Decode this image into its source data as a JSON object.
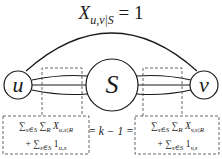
{
  "diagram": {
    "title": {
      "base": "X",
      "subscript": "u,v|S",
      "rhs": "= 1"
    },
    "nodes": [
      {
        "id": "u",
        "label": "u"
      },
      {
        "id": "S",
        "label": "S"
      },
      {
        "id": "v",
        "label": "v"
      }
    ],
    "equation": {
      "left": {
        "line1_sum1": "∑",
        "line1_sum1_sub": "s∈S",
        "line1_sum2": "∑",
        "line1_sum2_sub": "R",
        "line1_var": "X",
        "line1_var_sub": "u,s|R",
        "line2_plus": "+ ∑",
        "line2_sum_sub": "s∈S",
        "line2_var": "1",
        "line2_var_sub": "u,s"
      },
      "middle": "= k − 1 =",
      "right": {
        "line1_sum1": "∑",
        "line1_sum1_sub": "s∈S",
        "line1_sum2": "∑",
        "line1_sum2_sub": "R",
        "line1_var": "X",
        "line1_var_sub": "v,s|R",
        "line2_plus": "+ ∑",
        "line2_sum_sub": "s∈S",
        "line2_var": "1",
        "line2_var_sub": "v,s"
      }
    },
    "colors": {
      "stroke": "#1a1a1a",
      "dashed": "#555555",
      "background": "#ffffff"
    }
  }
}
